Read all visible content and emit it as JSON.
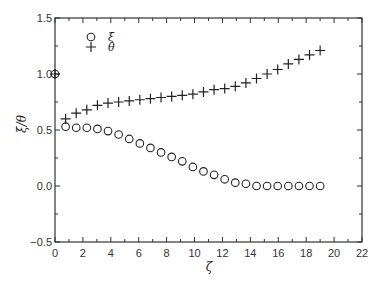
{
  "chart_data": {
    "type": "scatter",
    "title": "",
    "xlabel": "ζ",
    "ylabel": "ξ/θ",
    "xlim": [
      0,
      22
    ],
    "ylim": [
      -0.5,
      1.5
    ],
    "xticks": [
      0,
      2,
      4,
      6,
      8,
      10,
      12,
      14,
      16,
      18,
      20,
      22
    ],
    "xtick_labels": [
      "0",
      "2",
      "4",
      "6",
      "8",
      "10",
      "12",
      "14",
      "16",
      "18",
      "20",
      "22"
    ],
    "yticks": [
      -0.5,
      0.0,
      0.5,
      1.0,
      1.5
    ],
    "ytick_labels": [
      "−0.5",
      "0.0",
      "0.5",
      "1.0",
      "1.5"
    ],
    "grid": false,
    "legend_position": "upper left",
    "series": [
      {
        "name": "ξ",
        "marker": "circle",
        "x": [
          0,
          0.76,
          1.52,
          2.28,
          3.04,
          3.8,
          4.56,
          5.32,
          6.08,
          6.84,
          7.6,
          8.36,
          9.12,
          9.88,
          10.64,
          11.4,
          12.16,
          12.92,
          13.68,
          14.44,
          15.2,
          15.96,
          16.72,
          17.48,
          18.24,
          19.0
        ],
        "values": [
          1.0,
          0.53,
          0.52,
          0.52,
          0.51,
          0.49,
          0.46,
          0.42,
          0.38,
          0.34,
          0.3,
          0.26,
          0.22,
          0.17,
          0.13,
          0.1,
          0.06,
          0.03,
          0.02,
          0.0,
          0.0,
          0.0,
          0.0,
          0.0,
          0.0,
          0.0
        ]
      },
      {
        "name": "θ",
        "marker": "plus",
        "x": [
          0,
          0.76,
          1.52,
          2.28,
          3.04,
          3.8,
          4.56,
          5.32,
          6.08,
          6.84,
          7.6,
          8.36,
          9.12,
          9.88,
          10.64,
          11.4,
          12.16,
          12.92,
          13.68,
          14.44,
          15.2,
          15.96,
          16.72,
          17.48,
          18.24,
          19.0
        ],
        "values": [
          1.0,
          0.6,
          0.65,
          0.68,
          0.72,
          0.74,
          0.75,
          0.76,
          0.77,
          0.78,
          0.79,
          0.8,
          0.81,
          0.82,
          0.84,
          0.86,
          0.87,
          0.89,
          0.92,
          0.96,
          1.0,
          1.04,
          1.09,
          1.13,
          1.17,
          1.21
        ]
      }
    ]
  },
  "legend": {
    "items": [
      {
        "label": "ξ",
        "marker": "circle"
      },
      {
        "label": "θ",
        "marker": "plus"
      }
    ]
  },
  "axes": {
    "xlabel": "ζ",
    "ylabel": "ξ/θ"
  },
  "colors": {
    "axis": "#333333",
    "marker": "#222222"
  }
}
